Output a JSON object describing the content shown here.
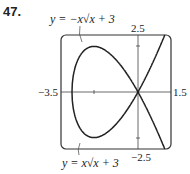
{
  "problem_number": "47.",
  "labels": {
    "top_curve": "y = −x√x + 3",
    "bottom_curve": "y = x√x + 3"
  },
  "ticks": {
    "xmin": "−3.5",
    "xmax": "1.5",
    "ymax": "2.5",
    "ymin": "−2.5"
  },
  "chart_data": {
    "type": "line",
    "title": "",
    "xlim": [
      -3.5,
      1.5
    ],
    "ylim": [
      -2.5,
      2.5
    ],
    "series": [
      {
        "name": "y = -x*sqrt(x+3)",
        "x": [
          -3,
          -2.5,
          -2,
          -1.5,
          -1,
          -0.5,
          0,
          0.5,
          1,
          1.5
        ],
        "values": [
          0,
          1.77,
          2,
          1.84,
          1.41,
          0.79,
          0,
          -0.94,
          -2,
          -3.18
        ]
      },
      {
        "name": "y = x*sqrt(x+3)",
        "x": [
          -3,
          -2.5,
          -2,
          -1.5,
          -1,
          -0.5,
          0,
          0.5,
          1,
          1.5
        ],
        "values": [
          0,
          -1.77,
          -2,
          -1.84,
          -1.41,
          -0.79,
          0,
          0.94,
          2,
          3.18
        ]
      }
    ]
  }
}
